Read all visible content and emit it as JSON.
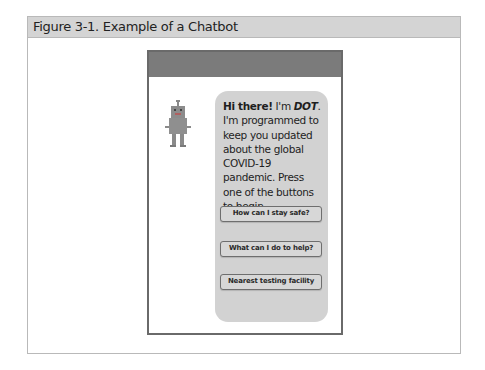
{
  "figure": {
    "title": "Figure 3-1. Example of a Chatbot"
  },
  "chatbot": {
    "avatar_icon": "robot-icon",
    "message": {
      "greeting": "Hi there!",
      "part1": " I'm ",
      "name": "DOT",
      "part2": ". I'm programmed to keep you updated about the global COVID-19 pandemic. Press one of the buttons to begin."
    },
    "buttons": [
      {
        "label": "How can I stay safe?"
      },
      {
        "label": "What can I do to help?"
      },
      {
        "label": "Nearest testing facility"
      }
    ]
  },
  "colors": {
    "header_bar": "#7b7b7b",
    "bubble": "#d2d2d2",
    "figure_header": "#d4d4d4"
  }
}
